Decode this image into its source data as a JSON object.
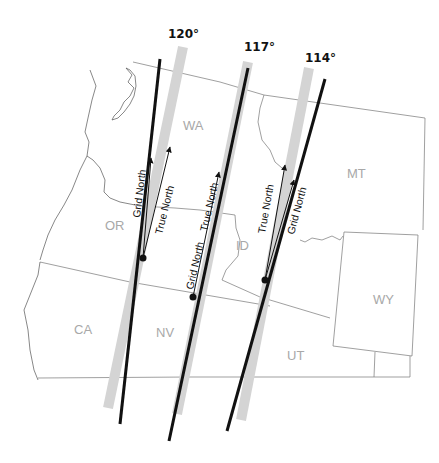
{
  "map": {
    "title": "Grid North vs True North across UTM zone meridians",
    "meridians": [
      {
        "label": "120°",
        "grid_label": "Grid North",
        "true_label": "True North"
      },
      {
        "label": "117°",
        "grid_label": "Grid North",
        "true_label": "True North"
      },
      {
        "label": "114°",
        "grid_label": "Grid North",
        "true_label": "True North"
      }
    ],
    "states": [
      {
        "code": "WA"
      },
      {
        "code": "OR"
      },
      {
        "code": "ID"
      },
      {
        "code": "MT"
      },
      {
        "code": "CA"
      },
      {
        "code": "NV"
      },
      {
        "code": "UT"
      },
      {
        "code": "WY"
      }
    ],
    "colors": {
      "meridian_line": "#111111",
      "central_band": "#d4d4d4",
      "state_label": "#a8a8a8",
      "border": "#777777"
    }
  }
}
